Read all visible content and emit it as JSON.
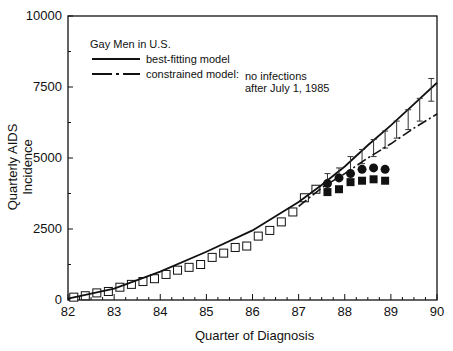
{
  "chart_data": {
    "type": "line",
    "title": "",
    "legend": {
      "heading": "Gay Men in U.S.",
      "entries": [
        {
          "style": "solid",
          "label": "best-fitting model"
        },
        {
          "style": "dash-dot",
          "label": "constrained model:",
          "note_line1": "no infections",
          "note_line2": "after July 1, 1985"
        }
      ],
      "position": "upper-left"
    },
    "xlabel": "Quarter of Diagnosis",
    "ylabel": "Quarterly AIDS Incidence",
    "xlim": [
      82,
      90
    ],
    "ylim": [
      0,
      10000
    ],
    "xticks": [
      "82",
      "83",
      "84",
      "85",
      "86",
      "87",
      "88",
      "89",
      "90"
    ],
    "yticks": [
      "0",
      "2500",
      "5000",
      "7500",
      "10000"
    ],
    "grid": false,
    "series": [
      {
        "name": "observed (open squares)",
        "marker": "open-square",
        "x": [
          82.125,
          82.375,
          82.625,
          82.875,
          83.125,
          83.375,
          83.625,
          83.875,
          84.125,
          84.375,
          84.625,
          84.875,
          85.125,
          85.375,
          85.625,
          85.875,
          86.125,
          86.375,
          86.625,
          86.875,
          87.125,
          87.375
        ],
        "y": [
          100,
          150,
          250,
          300,
          450,
          550,
          650,
          750,
          900,
          1050,
          1150,
          1250,
          1500,
          1650,
          1850,
          1900,
          2250,
          2450,
          2750,
          3100,
          3600,
          3900
        ]
      },
      {
        "name": "best-fitting model",
        "line": "solid",
        "x": [
          82,
          83,
          84,
          85,
          86,
          87,
          87.5,
          88,
          88.5,
          89,
          89.5,
          90
        ],
        "y": [
          50,
          400,
          1000,
          1700,
          2450,
          3450,
          4050,
          4700,
          5450,
          6150,
          6900,
          7650
        ]
      },
      {
        "name": "best-fitting model error bars",
        "x": [
          87.625,
          87.875,
          88.125,
          88.375,
          88.625,
          88.875,
          89.125,
          89.375,
          89.625,
          89.875
        ],
        "y": [
          4250,
          4450,
          4800,
          5050,
          5350,
          5650,
          6000,
          6350,
          6700,
          7400
        ],
        "err": [
          200,
          200,
          250,
          250,
          300,
          300,
          300,
          350,
          400,
          400
        ]
      },
      {
        "name": "constrained model",
        "line": "dash-dot",
        "x": [
          87,
          87.5,
          88,
          88.5,
          89,
          89.5,
          90
        ],
        "y": [
          3300,
          3950,
          4450,
          5000,
          5500,
          6050,
          6550
        ]
      },
      {
        "name": "filled circles",
        "marker": "filled-circle",
        "x": [
          87.625,
          87.875,
          88.125,
          88.375,
          88.625,
          88.875
        ],
        "y": [
          4100,
          4300,
          4450,
          4600,
          4650,
          4600
        ]
      },
      {
        "name": "filled squares",
        "marker": "filled-square",
        "x": [
          87.625,
          87.875,
          88.125,
          88.375,
          88.625,
          88.875
        ],
        "y": [
          3800,
          3900,
          4150,
          4200,
          4250,
          4200
        ]
      }
    ]
  }
}
